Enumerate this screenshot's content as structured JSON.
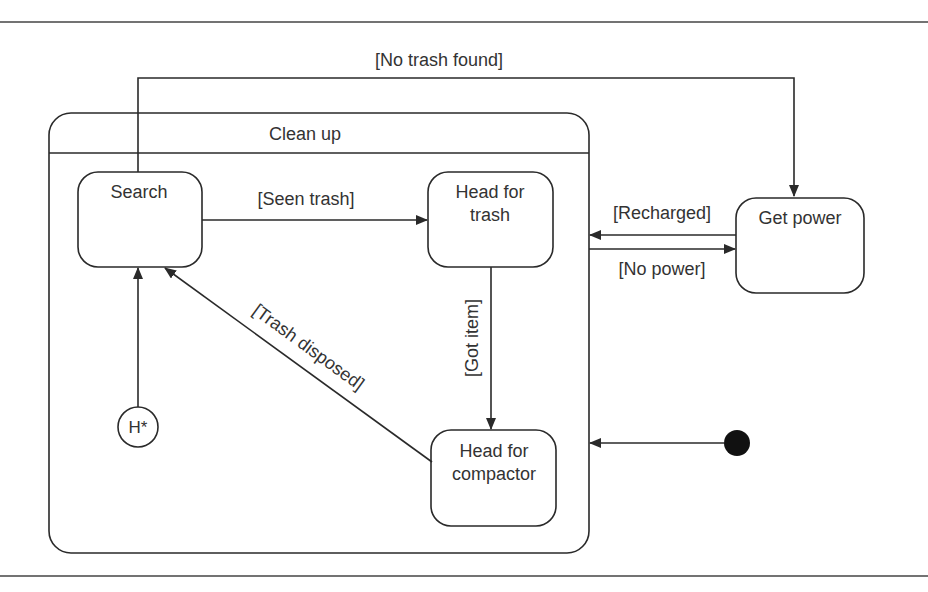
{
  "diagram": {
    "type": "UML state machine",
    "composite_state": {
      "label": "Clean up",
      "substates": [
        {
          "id": "search",
          "label_line1": "Search",
          "label_line2": ""
        },
        {
          "id": "head-for-trash",
          "label_line1": "Head for",
          "label_line2": "trash"
        },
        {
          "id": "head-for-compactor",
          "label_line1": "Head for",
          "label_line2": "compactor"
        }
      ],
      "history_state": {
        "label": "H*"
      }
    },
    "external_states": [
      {
        "id": "get-power",
        "label": "Get power"
      }
    ],
    "initial_state": {
      "label": ""
    },
    "transitions": [
      {
        "from": "search",
        "to": "get-power",
        "label": "[No trash found]"
      },
      {
        "from": "search",
        "to": "head-for-trash",
        "label": "[Seen trash]"
      },
      {
        "from": "head-for-trash",
        "to": "head-for-compactor",
        "label": "[Got item]"
      },
      {
        "from": "head-for-compactor",
        "to": "search",
        "label": "[Trash disposed]"
      },
      {
        "from": "get-power",
        "to": "clean-up",
        "label": "[Recharged]"
      },
      {
        "from": "clean-up",
        "to": "get-power",
        "label": "[No power]"
      },
      {
        "from": "history",
        "to": "search",
        "label": ""
      },
      {
        "from": "initial",
        "to": "clean-up",
        "label": ""
      }
    ]
  }
}
